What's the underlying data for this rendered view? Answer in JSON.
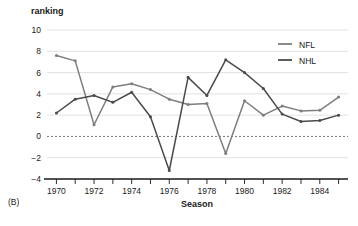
{
  "panel": {
    "label": "(B)"
  },
  "chart_data": {
    "type": "line",
    "title": "",
    "subtitle": "",
    "xlabel": "Season",
    "ylabel": "ranking",
    "ylabel_position": "top-left",
    "x": [
      1970,
      1971,
      1972,
      1973,
      1974,
      1975,
      1976,
      1977,
      1978,
      1979,
      1980,
      1981,
      1982,
      1983,
      1984,
      1985
    ],
    "xlim": [
      1969.5,
      1985.5
    ],
    "ylim": [
      -4,
      10
    ],
    "yticks": [
      10,
      8,
      6,
      4,
      2,
      0,
      -2,
      -4
    ],
    "ytick_labels": [
      "10",
      "8",
      "6",
      "4",
      "2",
      "0",
      "−2",
      "−4"
    ],
    "xticks": [
      1970,
      1971,
      1972,
      1973,
      1974,
      1975,
      1976,
      1977,
      1978,
      1979,
      1980,
      1981,
      1982,
      1983,
      1984,
      1985
    ],
    "xtick_labels": [
      "1970",
      "",
      "1972",
      "",
      "1974",
      "",
      "1976",
      "",
      "1978",
      "",
      "1980",
      "",
      "1982",
      "",
      "1984",
      ""
    ],
    "grid": "horizontal",
    "zero_reference_line": true,
    "legend_position": "top-right",
    "markers": true,
    "series": [
      {
        "name": "NFL",
        "color": "#7d7d7d",
        "values": [
          7.6,
          7.1,
          1.1,
          4.65,
          4.95,
          4.4,
          3.5,
          3.0,
          3.1,
          -1.6,
          3.35,
          2.0,
          2.85,
          2.4,
          2.45,
          3.7
        ]
      },
      {
        "name": "NHL",
        "color": "#4a4a4a",
        "values": [
          2.2,
          3.5,
          3.85,
          3.2,
          4.15,
          1.85,
          -3.2,
          5.55,
          3.85,
          7.2,
          6.0,
          4.5,
          2.1,
          1.4,
          1.5,
          2.0
        ]
      }
    ]
  }
}
